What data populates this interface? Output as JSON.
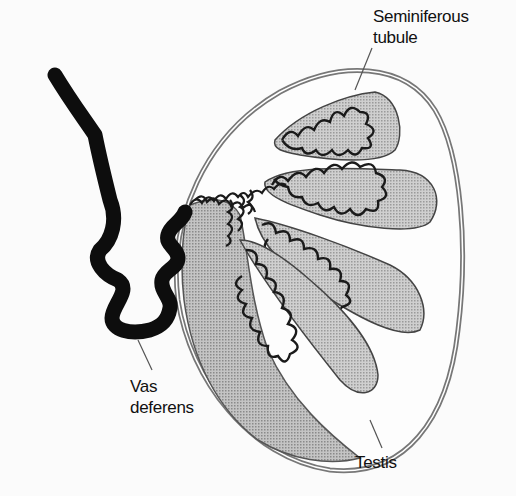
{
  "diagram": {
    "labels": {
      "seminiferous_tubule": {
        "line1": "Seminiferous",
        "line2": "tubule"
      },
      "vas_deferens": {
        "line1": "Vas",
        "line2": "deferens"
      },
      "testis": {
        "line1": "Testis"
      }
    },
    "colors": {
      "background": "#fbfbfb",
      "fill_gray": "#b9b9b9",
      "fill_light": "#c8c8c8",
      "outline": "#1a1a1a",
      "capsule": "#777777",
      "vas": "#0d0d0d"
    }
  }
}
